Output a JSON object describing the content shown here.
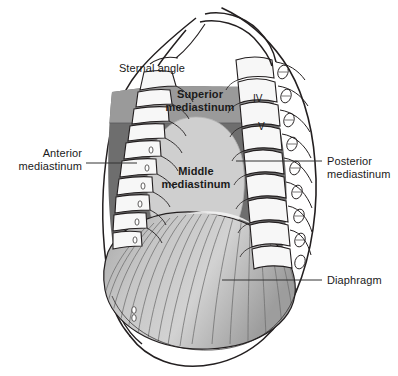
{
  "figure": {
    "background_color": "#ffffff"
  },
  "colors": {
    "superior_mediastinum_fill": "#9a9a9a",
    "anterior_posterior_mediastinum_fill": "#6e6e6e",
    "middle_mediastinum_fill": "#cfcfcf",
    "diaphragm_fill": "#bdbdbd",
    "bone_fill": "#f2f2f2",
    "outline": "#231f20",
    "leader_line": "#333333",
    "text": "#1a1a1a"
  },
  "labels": {
    "sternal_angle": "Sternal angle",
    "superior_mediastinum_line1": "Superior",
    "superior_mediastinum_line2": "mediastinum",
    "middle_mediastinum_line1": "Middle",
    "middle_mediastinum_line2": "mediastinum",
    "anterior_mediastinum_line1": "Anterior",
    "anterior_mediastinum_line2": "mediastinum",
    "posterior_mediastinum_line1": "Posterior",
    "posterior_mediastinum_line2": "mediastinum",
    "diaphragm": "Diaphragm"
  },
  "vertebrae": {
    "fourth": "IV",
    "fifth": "V"
  }
}
